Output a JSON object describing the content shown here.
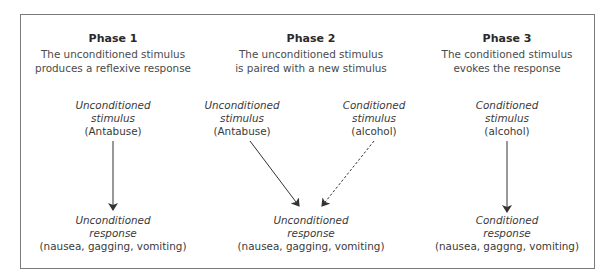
{
  "phases": [
    {
      "title": "Phase 1",
      "description": [
        "The unconditioned stimulus",
        "produces a reflexive response"
      ],
      "stimuli": [
        {
          "label": [
            "Unconditioned",
            "stimulus"
          ],
          "example": "(Antabuse)",
          "arrow": "solid"
        }
      ],
      "response": {
        "label": [
          "Unconditioned",
          "response"
        ],
        "example": "(nausea, gagging, vomiting)"
      }
    },
    {
      "title": "Phase 2",
      "description": [
        "The unconditioned stimulus",
        "is paired with a new stimulus"
      ],
      "stimuli": [
        {
          "label": [
            "Unconditioned",
            "stimulus"
          ],
          "example": "(Antabuse)",
          "arrow": "solid"
        },
        {
          "label": [
            "Conditioned",
            "stimulus"
          ],
          "example": "(alcohol)",
          "arrow": "dashed"
        }
      ],
      "response": {
        "label": [
          "Unconditioned",
          "response"
        ],
        "example": "(nausea, gagging, vomiting)"
      }
    },
    {
      "title": "Phase 3",
      "description": [
        "The conditioned stimulus",
        "evokes the response"
      ],
      "stimuli": [
        {
          "label": [
            "Conditioned",
            "stimulus"
          ],
          "example": "(alcohol)",
          "arrow": "solid"
        }
      ],
      "response": {
        "label": [
          "Conditioned",
          "response"
        ],
        "example": "(nausea, gaggng, vomiting)"
      }
    }
  ],
  "colors": {
    "border": "#7a7a7a",
    "text": "#3a3a3a",
    "arrow": "#333333"
  }
}
